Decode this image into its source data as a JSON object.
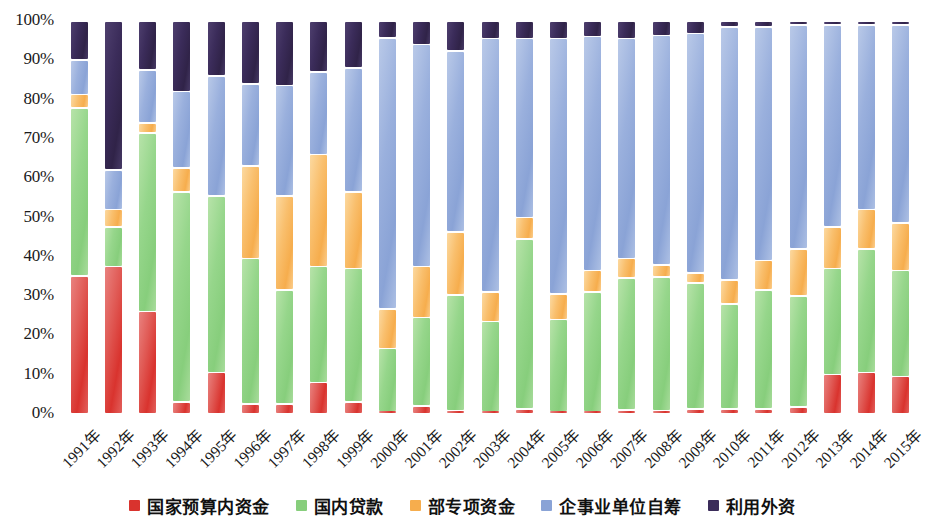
{
  "chart_data": {
    "type": "bar",
    "subtype": "stacked-percentage-bar",
    "title": "",
    "xlabel": "",
    "ylabel": "",
    "ylim": [
      0,
      100
    ],
    "y_unit": "%",
    "grid": false,
    "legend_position": "bottom",
    "y_ticks": [
      "0%",
      "10%",
      "20%",
      "30%",
      "40%",
      "50%",
      "60%",
      "70%",
      "80%",
      "90%",
      "100%"
    ],
    "y_tick_values": [
      0,
      10,
      20,
      30,
      40,
      50,
      60,
      70,
      80,
      90,
      100
    ],
    "categories": [
      "1991年",
      "1992年",
      "1993年",
      "1994年",
      "1995年",
      "1996年",
      "1997年",
      "1998年",
      "1999年",
      "2000年",
      "2001年",
      "2002年",
      "2003年",
      "2004年",
      "2005年",
      "2006年",
      "2007年",
      "2008年",
      "2009年",
      "2010年",
      "2011年",
      "2012年",
      "2013年",
      "2014年",
      "2015年"
    ],
    "series": [
      {
        "name": "国家预算内资金",
        "color": "#d9332e",
        "values": [
          35.0,
          37.5,
          26.0,
          3.0,
          10.5,
          2.5,
          2.5,
          8.0,
          3.0,
          0.6,
          2.0,
          0.8,
          0.5,
          1.2,
          0.5,
          0.5,
          1.0,
          0.8,
          1.3,
          1.3,
          1.3,
          1.8,
          10.0,
          10.5,
          9.5
        ]
      },
      {
        "name": "国内贷款",
        "color": "#87ce7c",
        "values": [
          42.8,
          10.0,
          45.5,
          53.5,
          45.0,
          37.0,
          29.0,
          29.5,
          34.0,
          16.0,
          22.5,
          29.5,
          23.0,
          43.3,
          23.5,
          30.5,
          33.5,
          34.0,
          32.0,
          26.7,
          30.2,
          28.2,
          27.0,
          31.5,
          27.0
        ]
      },
      {
        "name": "部专项资金",
        "color": "#f6ad4d",
        "values": [
          3.5,
          4.5,
          2.5,
          6.0,
          0.0,
          23.5,
          24.0,
          28.5,
          19.5,
          10.0,
          13.0,
          16.0,
          7.5,
          5.5,
          6.5,
          5.5,
          5.0,
          3.0,
          2.5,
          6.0,
          7.5,
          12.0,
          10.5,
          10.0,
          12.0
        ]
      },
      {
        "name": "企事业单位自筹",
        "color": "#8aa3d6",
        "values": [
          8.7,
          10.0,
          13.5,
          19.5,
          30.5,
          21.0,
          28.0,
          21.0,
          31.5,
          69.0,
          56.5,
          46.0,
          64.5,
          45.5,
          65.0,
          59.5,
          56.0,
          58.5,
          61.0,
          64.5,
          59.5,
          57.0,
          51.5,
          47.0,
          50.5
        ]
      },
      {
        "name": "利用外资",
        "color": "#3b2c5a",
        "values": [
          10.0,
          38.0,
          12.5,
          18.0,
          14.0,
          16.0,
          16.5,
          13.0,
          12.0,
          4.4,
          6.0,
          7.7,
          4.5,
          4.5,
          4.5,
          4.0,
          4.5,
          3.7,
          3.2,
          1.5,
          1.5,
          1.0,
          1.0,
          1.0,
          1.0
        ]
      }
    ]
  },
  "legend": {
    "items": [
      {
        "label": "国家预算内资金",
        "color": "#d9332e"
      },
      {
        "label": "国内贷款",
        "color": "#87ce7c"
      },
      {
        "label": "部专项资金",
        "color": "#f6ad4d"
      },
      {
        "label": "企事业单位自筹",
        "color": "#8aa3d6"
      },
      {
        "label": "利用外资",
        "color": "#3b2c5a"
      }
    ]
  }
}
